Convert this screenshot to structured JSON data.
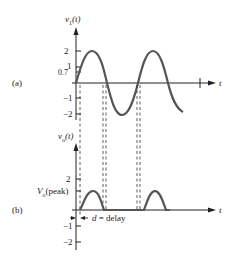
{
  "panel_a": {
    "label": "(a)",
    "y_axis_label": "v",
    "y_axis_sub": "1",
    "y_axis_arg": "(t)",
    "x_axis_label": "t",
    "ticks": [
      "2",
      "1",
      "0.7",
      "−1",
      "−2"
    ]
  },
  "panel_b": {
    "label": "(b)",
    "y_axis_label": "v",
    "y_axis_sub": "o",
    "y_axis_arg": "(t)",
    "x_axis_label": "t",
    "ticks": [
      "2",
      "−1",
      "−2"
    ],
    "peak_label_v": "V",
    "peak_label_sub": "o",
    "peak_label_rest": "(peak)",
    "delay_label_d": "d",
    "delay_label_rest": "= delay"
  },
  "colors": {
    "curve": "#555555",
    "axis": "#222222"
  }
}
